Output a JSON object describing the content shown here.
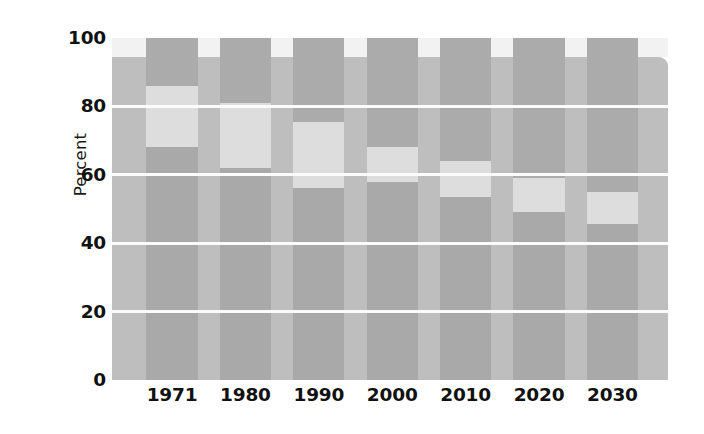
{
  "chart_data": {
    "type": "bar",
    "subtype": "stacked-percentage",
    "title": "",
    "subtitle": "",
    "xlabel": "",
    "ylabel": "Percent",
    "categories": [
      "1971",
      "1980",
      "1990",
      "2000",
      "2010",
      "2020",
      "2030"
    ],
    "ylim": [
      0,
      100
    ],
    "yticks": [
      0,
      20,
      40,
      60,
      80,
      100
    ],
    "ytick_labels": [
      "0",
      "20",
      "40",
      "60",
      "80",
      "100"
    ],
    "grid": "horizontal",
    "legend": "none",
    "series": [
      {
        "name": "bottom-segment",
        "color": "#a9a9a9",
        "values": [
          68,
          62,
          56,
          58,
          53.5,
          49,
          45.5
        ]
      },
      {
        "name": "middle-segment",
        "color": "#dddddd",
        "values": [
          18,
          19,
          19.5,
          10,
          10.5,
          10,
          9.5
        ]
      },
      {
        "name": "top-segment",
        "color": "#ababab",
        "values": [
          14,
          19,
          24.5,
          32,
          36,
          41,
          45
        ]
      }
    ],
    "cumulative_tops": [
      [
        68,
        86,
        100
      ],
      [
        62,
        81,
        100
      ],
      [
        56,
        75.5,
        100
      ],
      [
        58,
        68,
        100
      ],
      [
        53.5,
        64,
        100
      ],
      [
        49,
        59,
        100
      ],
      [
        45.5,
        55,
        100
      ]
    ],
    "bar_geometry": {
      "bar_width_pct": 9.2,
      "centers_pct": [
        10.8,
        24.0,
        37.2,
        50.4,
        63.6,
        76.8,
        90.0
      ]
    },
    "annotations": [],
    "colors": {
      "background_panel": "#bebebe",
      "panel_top_strip": "#f2f2f2",
      "gridline": "#fbfbfb",
      "text": "#111111",
      "page_background": "#ffffff"
    }
  }
}
